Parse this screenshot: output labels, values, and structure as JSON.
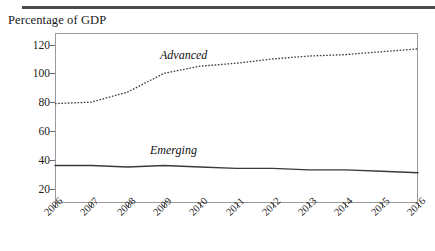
{
  "header": {
    "rule_color": "#4a4a4a"
  },
  "chart_data": {
    "type": "line",
    "title": "",
    "ylabel": "Percentage of GDP",
    "xlabel": "",
    "grid": false,
    "legend_position": "inline-labels",
    "ylim": [
      10,
      128
    ],
    "yticks": [
      20,
      40,
      60,
      80,
      100,
      120
    ],
    "ytick_labels": [
      "20",
      "40",
      "60",
      "80",
      "100",
      "120"
    ],
    "x": [
      2006,
      2007,
      2008,
      2009,
      2010,
      2011,
      2012,
      2013,
      2014,
      2015,
      2016
    ],
    "xtick_labels": [
      "2006",
      "2007",
      "2008",
      "2009",
      "2010",
      "2011",
      "2012",
      "2013",
      "2014",
      "2015",
      "2016"
    ],
    "series": [
      {
        "name": "Advanced",
        "style": "dotted",
        "color": "#3a3a3a",
        "values": [
          79,
          80,
          87,
          100,
          105,
          107,
          110,
          112,
          113,
          115,
          117
        ]
      },
      {
        "name": "Emerging",
        "style": "solid",
        "color": "#3a3a3a",
        "values": [
          36,
          36,
          35,
          36,
          35,
          34,
          34,
          33,
          33,
          32,
          31
        ]
      }
    ]
  },
  "labels": {
    "advanced": "Advanced",
    "emerging": "Emerging"
  }
}
